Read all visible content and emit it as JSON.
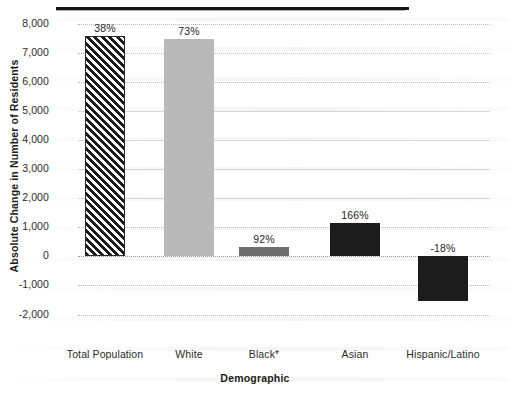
{
  "chart_data": {
    "type": "bar",
    "title": "",
    "xlabel": "Demographic",
    "ylabel": "Absolute Change in Number of Residents",
    "categories": [
      "Total Population",
      "White",
      "Black*",
      "Asian",
      "Hispanic/Latino"
    ],
    "values": [
      7600,
      7480,
      340,
      1150,
      -1520
    ],
    "data_labels": [
      "38%",
      "73%",
      "92%",
      "166%",
      "-18%"
    ],
    "ylim": [
      -2000,
      8000
    ],
    "ytick_labels": [
      "8,000",
      "7,000",
      "6,000",
      "5,000",
      "4,000",
      "3,000",
      "2,000",
      "1,000",
      "0",
      "-1,000",
      "-2,000"
    ],
    "ytick_values": [
      8000,
      7000,
      6000,
      5000,
      4000,
      3000,
      2000,
      1000,
      0,
      -1000,
      -2000
    ],
    "grid": true,
    "legend": "none",
    "bar_styles": [
      "hatched",
      "light-gray",
      "mid-gray",
      "black",
      "black"
    ],
    "colors": {
      "hatch_stroke": "#1a1a1a",
      "light_gray": "#b9b9b9",
      "mid_gray": "#6e6e6e",
      "black": "#1c1c1c",
      "gridline": "#b9b9b9",
      "text": "#231f20"
    }
  }
}
